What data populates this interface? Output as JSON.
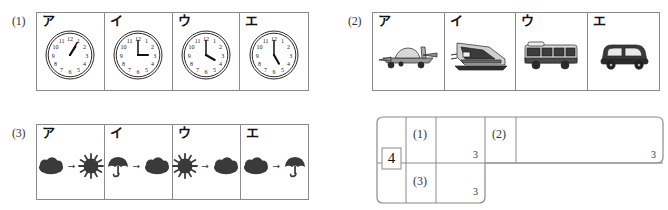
{
  "worksheet": {
    "big_number": "4",
    "sections": [
      {
        "id": "q1",
        "label": "(1)",
        "kind": "clocks",
        "choices": [
          {
            "key": "ア",
            "icon": "clock-icon",
            "hour": 1,
            "minute": 5
          },
          {
            "key": "イ",
            "icon": "clock-icon",
            "hour": 3,
            "minute": 0
          },
          {
            "key": "ウ",
            "icon": "clock-icon",
            "hour": 4,
            "minute": 0
          },
          {
            "key": "エ",
            "icon": "clock-icon",
            "hour": 5,
            "minute": 0
          }
        ],
        "clock_numerals": [
          "12",
          "1",
          "2",
          "3",
          "4",
          "5",
          "6",
          "7",
          "8",
          "9",
          "10",
          "11"
        ]
      },
      {
        "id": "q2",
        "label": "(2)",
        "kind": "vehicles",
        "choices": [
          {
            "key": "ア",
            "icon": "airplane-icon"
          },
          {
            "key": "イ",
            "icon": "train-icon"
          },
          {
            "key": "ウ",
            "icon": "bus-icon"
          },
          {
            "key": "エ",
            "icon": "car-icon"
          }
        ]
      },
      {
        "id": "q3",
        "label": "(3)",
        "kind": "weather",
        "arrow": "→",
        "choices": [
          {
            "key": "ア",
            "from": "cloud-icon",
            "to": "sun-icon"
          },
          {
            "key": "イ",
            "from": "umbrella-icon",
            "to": "cloud-icon"
          },
          {
            "key": "ウ",
            "from": "sun-icon",
            "to": "cloud-icon"
          },
          {
            "key": "エ",
            "from": "cloud-icon",
            "to": "umbrella-icon"
          }
        ]
      }
    ],
    "answer_table": {
      "rows": [
        {
          "label": "(1)",
          "answer": "",
          "points": "3"
        },
        {
          "label": "(2)",
          "answer": "",
          "points": "3"
        },
        {
          "label": "(3)",
          "answer": "",
          "points": "3"
        }
      ]
    }
  },
  "colors": {
    "border": "#8a8a8a",
    "ink": "#1a1a1a",
    "icon_fill": "#3a3a3a"
  }
}
